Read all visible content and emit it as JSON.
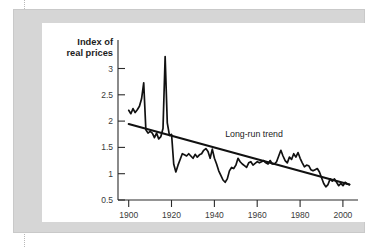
{
  "chart_data": {
    "type": "line",
    "title": "",
    "subtitle": "",
    "ylabel_line1": "Index of",
    "ylabel_line2": "real prices",
    "xlabel": "",
    "ylabel": "Index of real prices",
    "grid": false,
    "legend_position": "none",
    "xlim": [
      1895,
      2007
    ],
    "ylim": [
      0.35,
      3.15
    ],
    "xticks": [
      1900,
      1920,
      1940,
      1960,
      1980,
      2000
    ],
    "xtick_labels": [
      "1900",
      "1920",
      "1940",
      "1960",
      "1980",
      "2000"
    ],
    "yticks": [
      0.5,
      1,
      1.5,
      2,
      2.5,
      3
    ],
    "ytick_labels": [
      "0.5",
      "1",
      "1.5",
      "2",
      "2.5",
      "3"
    ],
    "annotations": [
      {
        "text": "Long-run trend",
        "x": 1945,
        "y": 1.46
      }
    ],
    "series": [
      {
        "name": "Index of real prices",
        "x": [
          1900,
          1901,
          1902,
          1903,
          1904,
          1905,
          1906,
          1907,
          1908,
          1909,
          1910,
          1911,
          1912,
          1913,
          1914,
          1915,
          1916,
          1917,
          1918,
          1919,
          1920,
          1921,
          1922,
          1923,
          1924,
          1925,
          1926,
          1927,
          1928,
          1929,
          1930,
          1931,
          1932,
          1933,
          1934,
          1935,
          1936,
          1937,
          1938,
          1939,
          1940,
          1941,
          1942,
          1943,
          1944,
          1945,
          1946,
          1947,
          1948,
          1949,
          1950,
          1951,
          1952,
          1953,
          1954,
          1955,
          1956,
          1957,
          1958,
          1959,
          1960,
          1961,
          1962,
          1963,
          1964,
          1965,
          1966,
          1967,
          1968,
          1969,
          1970,
          1971,
          1972,
          1973,
          1974,
          1975,
          1976,
          1977,
          1978,
          1979,
          1980,
          1981,
          1982,
          1983,
          1984,
          1985,
          1986,
          1987,
          1988,
          1989,
          1990,
          1991,
          1992,
          1993,
          1994,
          1995,
          1996,
          1997,
          1998,
          1999,
          2000,
          2001,
          2002,
          2003
        ],
        "values": [
          1.92,
          1.86,
          1.95,
          1.88,
          1.93,
          1.99,
          2.12,
          2.4,
          1.58,
          1.52,
          1.55,
          1.52,
          1.44,
          1.52,
          1.42,
          1.46,
          1.6,
          2.86,
          1.7,
          1.48,
          1.5,
          0.98,
          0.84,
          0.96,
          1.06,
          1.16,
          1.14,
          1.12,
          1.16,
          1.12,
          1.08,
          1.15,
          1.1,
          1.14,
          1.16,
          1.22,
          1.25,
          1.2,
          1.08,
          1.24,
          1.08,
          0.98,
          0.86,
          0.78,
          0.7,
          0.66,
          0.72,
          0.86,
          0.92,
          0.9,
          0.96,
          1.08,
          1.02,
          0.98,
          0.95,
          0.92,
          1.0,
          1.02,
          0.96,
          0.99,
          1.02,
          1.0,
          1.02,
          1.04,
          1.0,
          0.98,
          1.04,
          0.98,
          0.98,
          1.02,
          1.12,
          1.22,
          1.12,
          1.04,
          1.0,
          1.1,
          1.06,
          1.16,
          1.1,
          1.18,
          1.08,
          1.0,
          0.93,
          0.96,
          0.95,
          0.88,
          0.86,
          0.88,
          0.9,
          0.84,
          0.74,
          0.64,
          0.58,
          0.62,
          0.72,
          0.68,
          0.72,
          0.66,
          0.6,
          0.64,
          0.6,
          0.66,
          0.63,
          0.62
        ]
      }
    ],
    "trend": {
      "name": "Long-run trend",
      "x": [
        1900,
        2003
      ],
      "values": [
        1.68,
        0.62
      ]
    }
  }
}
